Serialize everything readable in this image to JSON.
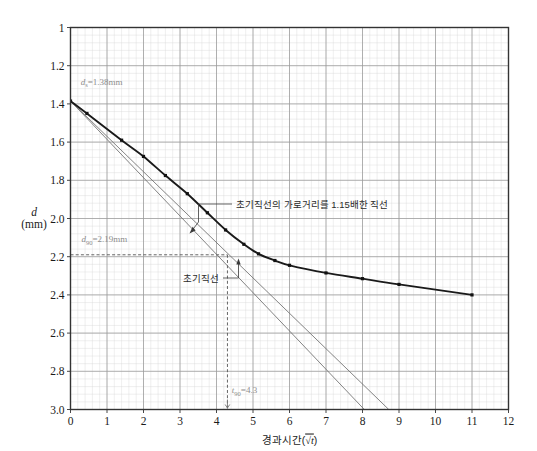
{
  "chart_data": {
    "type": "line",
    "title": "",
    "xlabel": "경과시간(√t)",
    "ylabel": "d (mm)",
    "ylabel_symbol": "d",
    "ylabel_unit": "(mm)",
    "xlim": [
      0,
      12
    ],
    "ylim": [
      1.0,
      3.0
    ],
    "y_inverted": true,
    "grid": true,
    "grid_major_x": 1,
    "grid_major_y": 0.2,
    "grid_minor_subdivisions": 5,
    "xticks": [
      0,
      1,
      2,
      3,
      4,
      5,
      6,
      7,
      8,
      9,
      10,
      11,
      12
    ],
    "xticklabels": [
      "0",
      "1",
      "2",
      "3",
      "4",
      "5",
      "6",
      "7",
      "8",
      "9",
      "10",
      "11",
      "12"
    ],
    "yticks": [
      1.0,
      1.2,
      1.4,
      1.6,
      1.8,
      2.0,
      2.2,
      2.4,
      2.6,
      2.8,
      3.0
    ],
    "yticklabels": [
      "1",
      "1.2",
      "1.4",
      "1.6",
      "1.8",
      "2.0",
      "2.2",
      "2.4",
      "2.6",
      "2.8",
      "3.0"
    ],
    "legend": "none",
    "series": [
      {
        "name": "측정곡선",
        "type": "line+markers",
        "color": "#1a1a1a",
        "x": [
          0.0,
          0.45,
          1.4,
          2.0,
          2.6,
          3.2,
          3.75,
          4.25,
          4.75,
          5.15,
          5.6,
          6.0,
          7.0,
          8.0,
          9.0,
          11.0
        ],
        "y": [
          1.385,
          1.45,
          1.59,
          1.675,
          1.775,
          1.87,
          1.97,
          2.06,
          2.135,
          2.185,
          2.22,
          2.245,
          2.285,
          2.315,
          2.345,
          2.4
        ]
      },
      {
        "name": "초기직선",
        "type": "line",
        "color": "#6e6e6e",
        "x": [
          0.0,
          8.05
        ],
        "y": [
          1.385,
          3.0
        ]
      },
      {
        "name": "초기직선의 가로거리를 1.15배한 직선",
        "type": "line",
        "color": "#6e6e6e",
        "x": [
          0.0,
          8.72
        ],
        "y": [
          1.385,
          3.0
        ]
      }
    ],
    "construction_lines": [
      {
        "name": "d90-horizontal",
        "orientation": "horizontal",
        "value": 2.19,
        "style": "dashed",
        "from_x": 0.0,
        "to_x": 4.3
      },
      {
        "name": "t90-vertical",
        "orientation": "vertical",
        "value": 4.3,
        "style": "dashed",
        "from_y": 2.19,
        "to_y": 3.0
      }
    ],
    "annotations": [
      {
        "name": "ds-label",
        "text": "d",
        "sub": "s",
        "value": "=1.38mm",
        "x": 1.0,
        "y": 1.32
      },
      {
        "name": "d90-label",
        "text": "d",
        "sub": "90",
        "value": "=2.19mm",
        "x": 0.55,
        "y": 2.13
      },
      {
        "name": "t90-label",
        "text": "t",
        "sub": "90",
        "value": "=4.3",
        "x": 4.5,
        "y": 2.92
      },
      {
        "name": "callout-115-line",
        "text": "초기직선의 가로거리를 1.15배한 직선",
        "points_to_x": 4.75,
        "points_to_y": 2.12
      },
      {
        "name": "callout-initial-line",
        "text": "초기직선",
        "points_to_x": 4.3,
        "points_to_y": 2.19
      }
    ],
    "markers": {
      "shape": "square",
      "size": 3.2,
      "color": "#111111"
    }
  },
  "labels": {
    "ds_symbol": "d",
    "ds_sub": "s",
    "ds_value": "=1.38mm",
    "d90_symbol": "d",
    "d90_sub": "90",
    "d90_value": "=2.19mm",
    "t90_symbol": "t",
    "t90_sub": "90",
    "t90_value": "=4.3",
    "callout_115": "초기직선의 가로거리를 1.15배한 직선",
    "callout_initial": "초기직선",
    "x_axis_caption": "경과시간(√t)",
    "x_axis_caption_main": "경과시간(",
    "x_axis_caption_sqrt": "√t",
    "x_axis_caption_close": ")",
    "y_axis_symbol": "d",
    "y_axis_unit": "(mm)"
  },
  "colors": {
    "curve": "#1a1a1a",
    "straight_lines": "#6e6e6e",
    "grid_major": "#9a9a9a",
    "grid_minor": "#d6d6d6",
    "axis": "#333333",
    "annotation_gray": "#8d8d8d",
    "background": "#ffffff"
  }
}
